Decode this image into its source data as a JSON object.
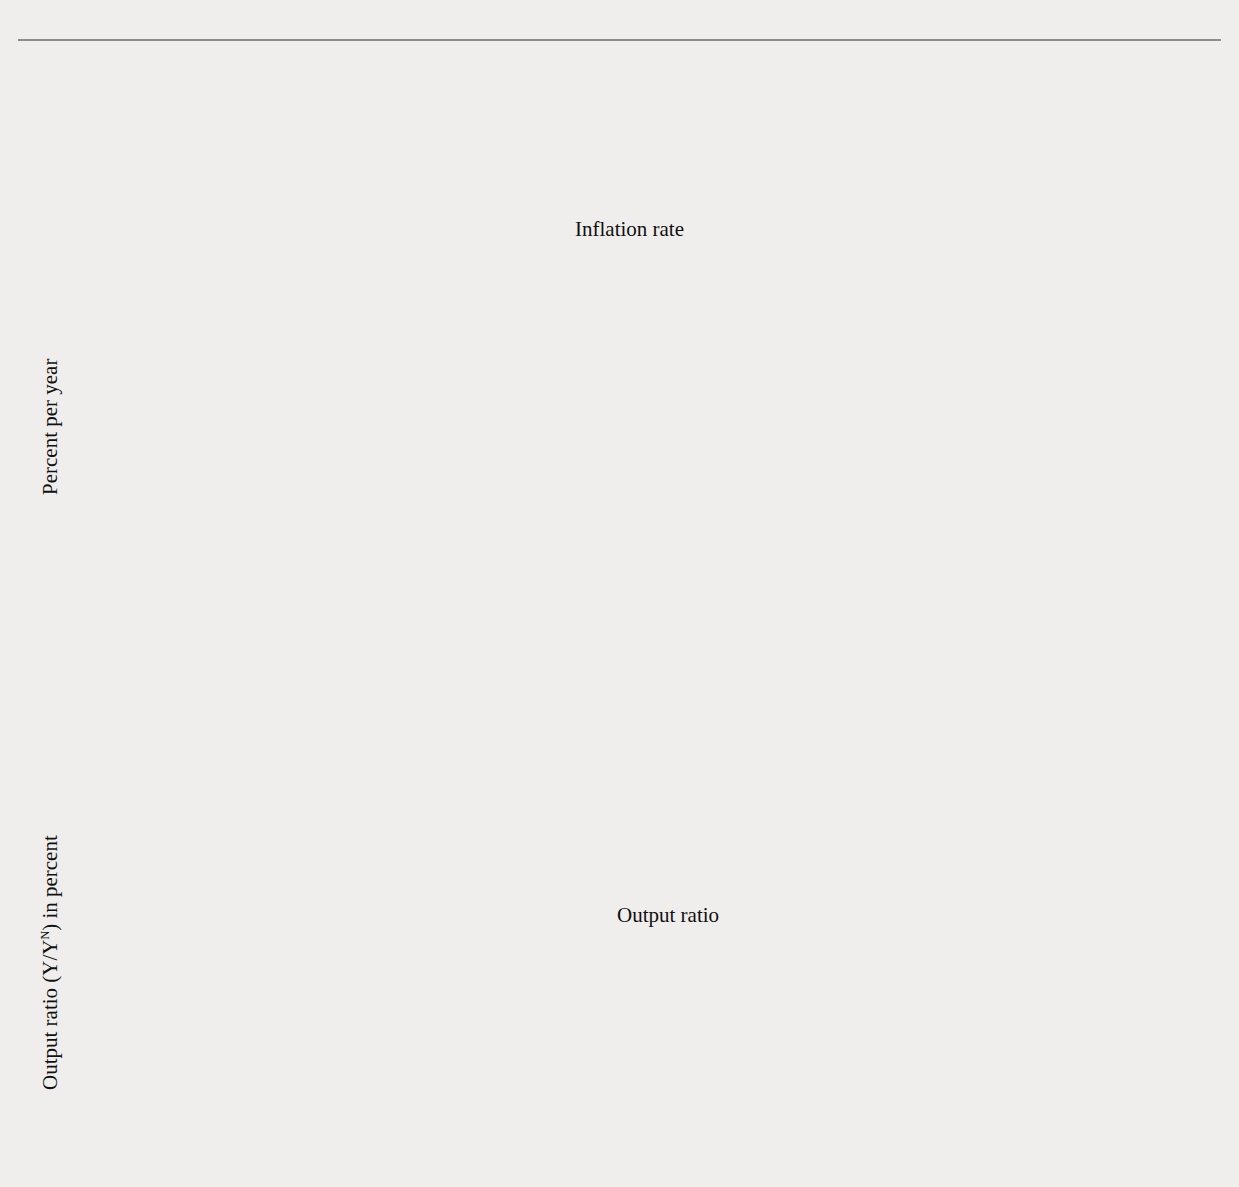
{
  "figure": {
    "background_color": "#efeeec",
    "plot_background_color": "#ffffff"
  },
  "chart_data": [
    {
      "type": "area",
      "id": "inflation-panel",
      "title": "Inflation and the Output Ratio Have No Systematic Relation",
      "series_label": "Inflation rate",
      "xlabel": "",
      "ylabel": "Percent per year",
      "xlim": [
        1960,
        2011
      ],
      "ylim": [
        0,
        12
      ],
      "yticks": [
        0,
        2,
        4,
        6,
        8,
        10,
        12
      ],
      "xticks": [
        1960,
        1965,
        1970,
        1975,
        1980,
        1985,
        1990,
        1995,
        2000,
        2005,
        2010
      ],
      "minor_xtick_interval": 1,
      "grid": false,
      "legend": "inline-annotation",
      "fill_color": "#d2d2d2",
      "line_color": "#a3a3a3",
      "x": [
        1960.0,
        1960.25,
        1960.5,
        1960.75,
        1961.0,
        1961.25,
        1961.5,
        1961.75,
        1962.0,
        1962.25,
        1962.5,
        1962.75,
        1963.0,
        1963.25,
        1963.5,
        1963.75,
        1964.0,
        1964.25,
        1964.5,
        1964.75,
        1965.0,
        1965.25,
        1965.5,
        1965.75,
        1966.0,
        1966.25,
        1966.5,
        1966.75,
        1967.0,
        1967.25,
        1967.5,
        1967.75,
        1968.0,
        1968.25,
        1968.5,
        1968.75,
        1969.0,
        1969.25,
        1969.5,
        1969.75,
        1970.0,
        1970.25,
        1970.5,
        1970.75,
        1971.0,
        1971.25,
        1971.5,
        1971.75,
        1972.0,
        1972.25,
        1972.5,
        1972.75,
        1973.0,
        1973.25,
        1973.5,
        1973.75,
        1974.0,
        1974.25,
        1974.5,
        1974.75,
        1975.0,
        1975.25,
        1975.5,
        1975.75,
        1976.0,
        1976.25,
        1976.5,
        1976.75,
        1977.0,
        1977.25,
        1977.5,
        1977.75,
        1978.0,
        1978.25,
        1978.5,
        1978.75,
        1979.0,
        1979.25,
        1979.5,
        1979.75,
        1980.0,
        1980.25,
        1980.5,
        1980.75,
        1981.0,
        1981.25,
        1981.5,
        1981.75,
        1982.0,
        1982.25,
        1982.5,
        1982.75,
        1983.0,
        1983.25,
        1983.5,
        1983.75,
        1984.0,
        1984.25,
        1984.5,
        1984.75,
        1985.0,
        1985.25,
        1985.5,
        1985.75,
        1986.0,
        1986.25,
        1986.5,
        1986.75,
        1987.0,
        1987.25,
        1987.5,
        1987.75,
        1988.0,
        1988.25,
        1988.5,
        1988.75,
        1989.0,
        1989.25,
        1989.5,
        1989.75,
        1990.0,
        1990.25,
        1990.5,
        1990.75,
        1991.0,
        1991.25,
        1991.5,
        1991.75,
        1992.0,
        1992.25,
        1992.5,
        1992.75,
        1993.0,
        1993.25,
        1993.5,
        1993.75,
        1994.0,
        1994.25,
        1994.5,
        1994.75,
        1995.0,
        1995.25,
        1995.5,
        1995.75,
        1996.0,
        1996.25,
        1996.5,
        1996.75,
        1997.0,
        1997.25,
        1997.5,
        1997.75,
        1998.0,
        1998.25,
        1998.5,
        1998.75,
        1999.0,
        1999.25,
        1999.5,
        1999.75,
        2000.0,
        2000.25,
        2000.5,
        2000.75,
        2001.0,
        2001.25,
        2001.5,
        2001.75,
        2002.0,
        2002.25,
        2002.5,
        2002.75,
        2003.0,
        2003.25,
        2003.5,
        2003.75,
        2004.0,
        2004.25,
        2004.5,
        2004.75,
        2005.0,
        2005.25,
        2005.5,
        2005.75,
        2006.0,
        2006.25,
        2006.5,
        2006.75,
        2007.0,
        2007.25,
        2007.5,
        2007.75,
        2008.0,
        2008.25,
        2008.5,
        2008.75,
        2009.0,
        2009.25,
        2009.5,
        2009.75,
        2010.0,
        2010.25,
        2010.5,
        2010.75
      ],
      "y": [
        1.5,
        1.4,
        1.1,
        1.3,
        1.2,
        0.9,
        1.0,
        1.1,
        1.3,
        1.4,
        1.2,
        1.1,
        1.0,
        0.9,
        0.8,
        0.9,
        1.1,
        1.2,
        1.2,
        1.1,
        1.1,
        1.3,
        1.6,
        1.9,
        2.2,
        2.6,
        2.9,
        3.1,
        3.0,
        2.7,
        2.8,
        3.2,
        3.6,
        3.9,
        4.2,
        4.3,
        4.5,
        4.8,
        5.2,
        5.5,
        5.3,
        5.0,
        4.9,
        4.9,
        4.6,
        4.3,
        4.0,
        3.9,
        3.8,
        3.9,
        4.1,
        4.4,
        4.2,
        4.4,
        5.0,
        5.8,
        6.8,
        8.0,
        9.3,
        10.2,
        10.5,
        9.8,
        8.5,
        7.2,
        6.3,
        5.7,
        5.4,
        5.2,
        5.6,
        6.2,
        6.4,
        6.6,
        6.5,
        6.8,
        7.2,
        7.5,
        7.7,
        8.2,
        8.4,
        8.6,
        8.9,
        8.6,
        8.8,
        9.1,
        9.4,
        9.7,
        9.2,
        8.5,
        7.6,
        6.5,
        5.5,
        4.8,
        4.3,
        3.9,
        3.6,
        3.4,
        3.5,
        3.6,
        3.6,
        3.5,
        3.3,
        3.2,
        3.1,
        2.9,
        2.6,
        2.3,
        2.1,
        2.3,
        2.6,
        2.9,
        3.1,
        3.3,
        3.4,
        3.6,
        3.8,
        3.9,
        4.0,
        4.1,
        3.9,
        3.7,
        3.6,
        3.8,
        4.0,
        4.1,
        4.0,
        3.7,
        3.4,
        3.2,
        3.0,
        2.9,
        2.8,
        2.7,
        2.6,
        2.6,
        2.5,
        2.5,
        2.4,
        2.4,
        2.3,
        2.3,
        2.3,
        2.2,
        2.2,
        2.1,
        2.0,
        1.9,
        1.9,
        1.9,
        1.9,
        1.8,
        1.7,
        1.6,
        1.2,
        1.1,
        1.1,
        1.2,
        1.3,
        1.4,
        1.5,
        1.7,
        1.9,
        2.2,
        2.4,
        2.3,
        2.5,
        2.3,
        2.0,
        1.8,
        1.7,
        1.6,
        1.6,
        1.7,
        1.8,
        1.9,
        2.0,
        2.2,
        2.4,
        2.6,
        2.7,
        2.9,
        3.0,
        3.2,
        3.3,
        3.4,
        3.5,
        3.4,
        3.2,
        3.0,
        2.9,
        2.8,
        2.6,
        2.5,
        2.3,
        2.4,
        2.0,
        1.2,
        0.1,
        0.3,
        0.9,
        1.2,
        1.3,
        1.2,
        1.1,
        1.3
      ]
    },
    {
      "type": "area",
      "id": "output-ratio-panel",
      "series_label": "Output ratio",
      "xlabel": "",
      "ylabel": "Output ratio (Y/YN) in percent",
      "ylabel_parts": {
        "prefix": "Output ratio (Y/Y",
        "superscript": "N",
        "suffix": ") in percent"
      },
      "xlim": [
        1960,
        2011
      ],
      "ylim": [
        80,
        110
      ],
      "yticks": [
        80,
        85,
        90,
        95,
        100,
        105,
        110
      ],
      "xticks": [
        1960,
        1965,
        1970,
        1975,
        1980,
        1985,
        1990,
        1995,
        2000,
        2005,
        2010
      ],
      "minor_xtick_interval": 1,
      "baseline": 100,
      "grid": false,
      "legend": "inline-annotation",
      "fill_color": "#cfcfcf",
      "line_color": "#3a3a3a",
      "baseline_color": "#1a1a1a",
      "x": [
        1960.0,
        1960.25,
        1960.5,
        1960.75,
        1961.0,
        1961.25,
        1961.5,
        1961.75,
        1962.0,
        1962.25,
        1962.5,
        1962.75,
        1963.0,
        1963.25,
        1963.5,
        1963.75,
        1964.0,
        1964.25,
        1964.5,
        1964.75,
        1965.0,
        1965.25,
        1965.5,
        1965.75,
        1966.0,
        1966.25,
        1966.5,
        1966.75,
        1967.0,
        1967.25,
        1967.5,
        1967.75,
        1968.0,
        1968.25,
        1968.5,
        1968.75,
        1969.0,
        1969.25,
        1969.5,
        1969.75,
        1970.0,
        1970.25,
        1970.5,
        1970.75,
        1971.0,
        1971.25,
        1971.5,
        1971.75,
        1972.0,
        1972.25,
        1972.5,
        1972.75,
        1973.0,
        1973.25,
        1973.5,
        1973.75,
        1974.0,
        1974.25,
        1974.5,
        1974.75,
        1975.0,
        1975.25,
        1975.5,
        1975.75,
        1976.0,
        1976.25,
        1976.5,
        1976.75,
        1977.0,
        1977.25,
        1977.5,
        1977.75,
        1978.0,
        1978.25,
        1978.5,
        1978.75,
        1979.0,
        1979.25,
        1979.5,
        1979.75,
        1980.0,
        1980.25,
        1980.5,
        1980.75,
        1981.0,
        1981.25,
        1981.5,
        1981.75,
        1982.0,
        1982.25,
        1982.5,
        1982.75,
        1983.0,
        1983.25,
        1983.5,
        1983.75,
        1984.0,
        1984.25,
        1984.5,
        1984.75,
        1985.0,
        1985.25,
        1985.5,
        1985.75,
        1986.0,
        1986.25,
        1986.5,
        1986.75,
        1987.0,
        1987.25,
        1987.5,
        1987.75,
        1988.0,
        1988.25,
        1988.5,
        1988.75,
        1989.0,
        1989.25,
        1989.5,
        1989.75,
        1990.0,
        1990.25,
        1990.5,
        1990.75,
        1991.0,
        1991.25,
        1991.5,
        1991.75,
        1992.0,
        1992.25,
        1992.5,
        1992.75,
        1993.0,
        1993.25,
        1993.5,
        1993.75,
        1994.0,
        1994.25,
        1994.5,
        1994.75,
        1995.0,
        1995.25,
        1995.5,
        1995.75,
        1996.0,
        1996.25,
        1996.5,
        1996.75,
        1997.0,
        1997.25,
        1997.5,
        1997.75,
        1998.0,
        1998.25,
        1998.5,
        1998.75,
        1999.0,
        1999.25,
        1999.5,
        1999.75,
        2000.0,
        2000.25,
        2000.5,
        2000.75,
        2001.0,
        2001.25,
        2001.5,
        2001.75,
        2002.0,
        2002.25,
        2002.5,
        2002.75,
        2003.0,
        2003.25,
        2003.5,
        2003.75,
        2004.0,
        2004.25,
        2004.5,
        2004.75,
        2005.0,
        2005.25,
        2005.5,
        2005.75,
        2006.0,
        2006.25,
        2006.5,
        2006.75,
        2007.0,
        2007.25,
        2007.5,
        2007.75,
        2008.0,
        2008.25,
        2008.5,
        2008.75,
        2009.0,
        2009.25,
        2009.5,
        2009.75,
        2010.0,
        2010.25,
        2010.5,
        2010.75
      ],
      "y": [
        99.9,
        99.2,
        98.2,
        97.0,
        95.7,
        95.5,
        96.3,
        97.3,
        98.3,
        98.5,
        98.3,
        97.8,
        97.7,
        98.0,
        98.4,
        98.8,
        99.3,
        99.6,
        99.8,
        100.1,
        100.2,
        100.6,
        101.5,
        102.4,
        103.6,
        105.0,
        106.3,
        106.7,
        106.2,
        105.5,
        105.4,
        105.5,
        105.4,
        105.8,
        106.2,
        106.1,
        105.9,
        106.1,
        105.5,
        104.5,
        103.2,
        102.0,
        101.0,
        100.0,
        100.3,
        100.6,
        100.3,
        100.0,
        100.6,
        101.6,
        102.8,
        103.8,
        104.6,
        105.0,
        104.4,
        103.0,
        101.2,
        99.6,
        98.0,
        96.5,
        95.7,
        96.2,
        97.2,
        97.8,
        98.2,
        98.5,
        98.2,
        98.0,
        98.4,
        99.1,
        99.8,
        100.5,
        101.2,
        102.0,
        102.5,
        102.2,
        101.5,
        101.0,
        100.2,
        99.0,
        98.0,
        97.3,
        98.2,
        99.2,
        99.5,
        98.4,
        97.6,
        96.2,
        94.5,
        93.0,
        92.0,
        91.3,
        90.8,
        91.6,
        93.0,
        94.4,
        95.6,
        96.6,
        97.1,
        97.3,
        97.5,
        97.8,
        98.0,
        98.1,
        98.2,
        98.0,
        98.1,
        98.3,
        98.4,
        98.5,
        98.8,
        99.2,
        99.6,
        100.0,
        100.4,
        100.7,
        100.9,
        100.9,
        100.8,
        100.7,
        100.9,
        100.6,
        100.0,
        99.2,
        98.4,
        98.0,
        98.1,
        98.4,
        98.4,
        98.2,
        98.0,
        98.2,
        98.3,
        98.1,
        97.9,
        98.1,
        98.4,
        98.6,
        98.8,
        98.9,
        98.7,
        98.5,
        98.5,
        98.7,
        98.8,
        99.1,
        99.4,
        99.6,
        99.8,
        100.1,
        100.4,
        100.8,
        101.1,
        101.4,
        101.7,
        102.0,
        102.3,
        102.6,
        103.0,
        103.4,
        103.8,
        103.7,
        103.3,
        102.5,
        101.5,
        100.7,
        100.1,
        99.8,
        99.7,
        99.6,
        99.6,
        99.7,
        99.6,
        99.5,
        99.7,
        100.1,
        100.2,
        100.1,
        100.0,
        100.2,
        100.4,
        100.6,
        100.4,
        100.2,
        100.5,
        100.7,
        100.5,
        100.2,
        100.1,
        100.0,
        99.8,
        99.6,
        99.3,
        98.9,
        97.8,
        96.0,
        94.0,
        92.4,
        91.8,
        92.1,
        92.6,
        92.3,
        92.2,
        92.4
      ]
    }
  ]
}
